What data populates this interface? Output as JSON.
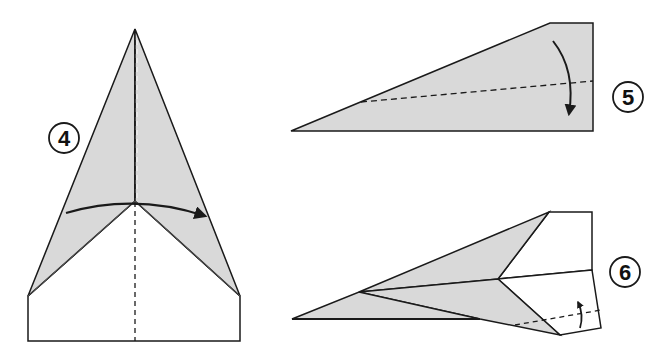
{
  "colors": {
    "paper_shaded": "#d9d9d9",
    "paper_white": "#ffffff",
    "line": "#1a1a1a"
  },
  "steps": [
    {
      "number": "4",
      "description": "Fold the plane in half along the centre dashed line",
      "arrow": "curved-right"
    },
    {
      "number": "5",
      "description": "Fold the wing down along the dashed line",
      "arrow": "curved-down"
    },
    {
      "number": "6",
      "description": "Fold the wing tip up along the dashed line",
      "arrow": "small-up"
    }
  ]
}
